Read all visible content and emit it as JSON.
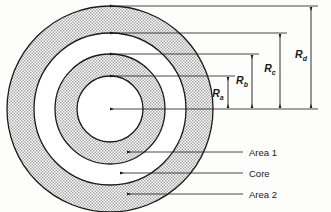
{
  "figure": {
    "background_color": "#fdfdfb",
    "line_color": "#1a1a1a",
    "shade_fill": "#d8d8d8",
    "white_fill": "#ffffff"
  },
  "geometry": {
    "center_x": 110,
    "center_y": 109,
    "radii_px": {
      "Ra": 33,
      "Rb": 55,
      "Rc": 76,
      "Rd": 103
    }
  },
  "dimensions": [
    {
      "id": "Ra",
      "symbol": "R",
      "subscript": "a",
      "label": "R_a",
      "x": 228,
      "value_px": 33
    },
    {
      "id": "Rb",
      "symbol": "R",
      "subscript": "b",
      "label": "R_b",
      "x": 252,
      "value_px": 55
    },
    {
      "id": "Rc",
      "symbol": "R",
      "subscript": "c",
      "label": "R_c",
      "x": 280,
      "value_px": 76
    },
    {
      "id": "Rd",
      "symbol": "R",
      "subscript": "d",
      "label": "R_d",
      "x": 311,
      "value_px": 103
    }
  ],
  "callouts": [
    {
      "id": "area1",
      "label": "Area 1",
      "y": 152
    },
    {
      "id": "core",
      "label": "Core",
      "y": 173
    },
    {
      "id": "area2",
      "label": "Area 2",
      "y": 194
    }
  ],
  "regions": [
    {
      "id": "inner-core-disc",
      "name": "inner disc",
      "fill": "white",
      "from": 0,
      "to": 33
    },
    {
      "id": "area1-ring",
      "name": "Area 1",
      "fill": "shade",
      "from": 33,
      "to": 55
    },
    {
      "id": "core-ring",
      "name": "Core",
      "fill": "white",
      "from": 55,
      "to": 76
    },
    {
      "id": "area2-ring",
      "name": "Area 2",
      "fill": "shade",
      "from": 76,
      "to": 103
    }
  ]
}
